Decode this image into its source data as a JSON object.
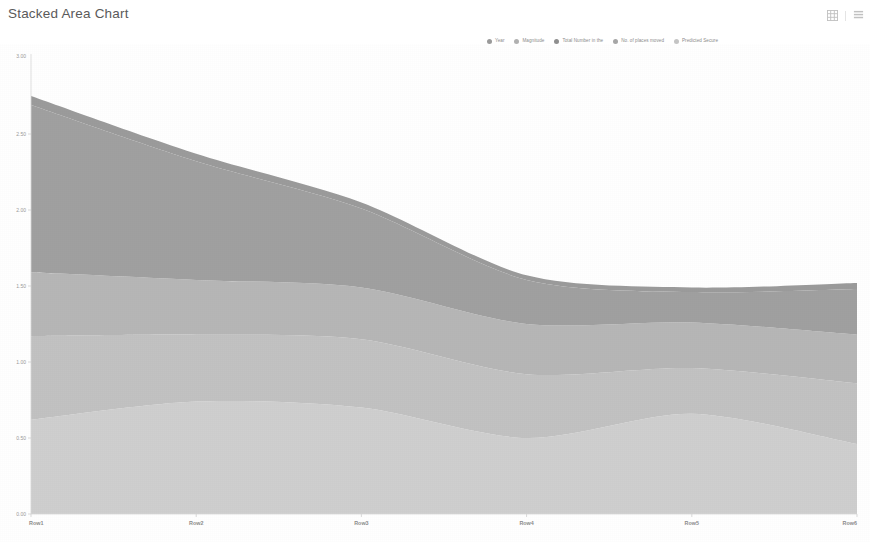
{
  "header": {
    "title": "Stacked Area Chart"
  },
  "toolbar": {
    "items": [
      {
        "name": "grid-view-icon",
        "label": "Grid view"
      },
      {
        "name": "more-menu-icon",
        "label": "More options"
      }
    ]
  },
  "colors": {
    "series": [
      "#9a9a9a",
      "#b0b0b0",
      "#8e8e8e",
      "#a6a6a6",
      "#c4c4c4"
    ],
    "band_fills": [
      "#cfcfcf",
      "#c2c2c2",
      "#b6b6b6",
      "#a0a0a0",
      "#9b9b9b"
    ],
    "axis": "#d8d8d8",
    "tick_text": "#9a9a9a",
    "title_text": "#5a5a5a"
  },
  "chart_data": {
    "type": "area",
    "stacked": true,
    "title": "Stacked Area Chart",
    "xlabel": "",
    "ylabel": "",
    "ylim": [
      0.0,
      3.0
    ],
    "grid": false,
    "legend_position": "top-right",
    "categories": [
      "Row1",
      "Row2",
      "Row3",
      "Row4",
      "Row5",
      "Row6"
    ],
    "x_tick_labels": [
      "Row1",
      "Row2",
      "Row3",
      "Row4",
      "Row5",
      "Row6"
    ],
    "y_tick_values": [
      0.0,
      0.5,
      1.0,
      1.5,
      2.0,
      2.5
    ],
    "y_tick_labels": [
      "0.00",
      "0.50",
      "1.00",
      "1.50",
      "2.00",
      "2.50"
    ],
    "series": [
      {
        "name": "Year",
        "values": [
          0.62,
          0.74,
          0.7,
          0.5,
          0.66,
          0.46
        ]
      },
      {
        "name": "Magnitude",
        "values": [
          0.55,
          0.44,
          0.45,
          0.42,
          0.3,
          0.4
        ]
      },
      {
        "name": "Total Number in the",
        "values": [
          0.42,
          0.36,
          0.34,
          0.33,
          0.3,
          0.32
        ]
      },
      {
        "name": "No. of places moved",
        "values": [
          1.1,
          0.78,
          0.52,
          0.29,
          0.2,
          0.3
        ]
      },
      {
        "name": "Predicted Secure",
        "values": [
          0.06,
          0.05,
          0.04,
          0.03,
          0.03,
          0.04
        ]
      }
    ]
  }
}
